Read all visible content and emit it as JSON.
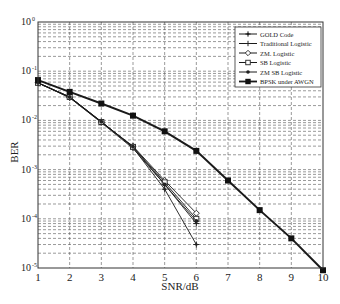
{
  "chart_data": {
    "type": "line",
    "title": "",
    "xlabel": "SNR/dB",
    "ylabel": "BER",
    "xscale": "linear",
    "yscale": "log",
    "xlim": [
      1,
      10
    ],
    "ylim": [
      1e-05,
      1
    ],
    "xticks": [
      "1",
      "2",
      "3",
      "4",
      "5",
      "6",
      "7",
      "8",
      "9",
      "10"
    ],
    "yticks": [
      {
        "base": "10",
        "exp": "0",
        "value": 1
      },
      {
        "base": "10",
        "exp": "-1",
        "value": 0.1
      },
      {
        "base": "10",
        "exp": "-2",
        "value": 0.01
      },
      {
        "base": "10",
        "exp": "-3",
        "value": 0.001
      },
      {
        "base": "10",
        "exp": "-4",
        "value": 0.0001
      },
      {
        "base": "10",
        "exp": "-5",
        "value": 1e-05
      }
    ],
    "grid": true,
    "legend_position": "upper right",
    "series": [
      {
        "name": "GOLD Code",
        "marker": "plus-dot",
        "x": [
          1,
          2,
          3,
          4,
          5,
          6
        ],
        "values": [
          0.058,
          0.03,
          0.0095,
          0.0028,
          0.0004,
          3e-05
        ]
      },
      {
        "name": "Traditional Logistic",
        "marker": "plus",
        "x": [
          1,
          2,
          3,
          4,
          5,
          6
        ],
        "values": [
          0.058,
          0.029,
          0.009,
          0.0027,
          0.0005,
          8e-05
        ]
      },
      {
        "name": "ZM. Logistic",
        "marker": "diamond",
        "x": [
          1,
          2,
          3,
          4,
          5,
          6
        ],
        "values": [
          0.058,
          0.029,
          0.0092,
          0.003,
          0.0006,
          0.00013
        ]
      },
      {
        "name": "SB Logistic",
        "marker": "square-open",
        "x": [
          1,
          2,
          3,
          4,
          5,
          6
        ],
        "values": [
          0.058,
          0.03,
          0.0093,
          0.0029,
          0.00055,
          0.0001
        ]
      },
      {
        "name": "ZM SB Logistic",
        "marker": "dot",
        "x": [
          1,
          2,
          3,
          4,
          5,
          6
        ],
        "values": [
          0.058,
          0.03,
          0.0094,
          0.0029,
          0.0005,
          9e-05
        ]
      },
      {
        "name": "BPSK under AWGN",
        "marker": "square-filled",
        "x": [
          1,
          2,
          3,
          4,
          5,
          6,
          7,
          8,
          9,
          10
        ],
        "values": [
          0.066,
          0.038,
          0.022,
          0.0125,
          0.006,
          0.0024,
          0.0006,
          0.00015,
          4e-05,
          9e-06
        ]
      }
    ]
  }
}
